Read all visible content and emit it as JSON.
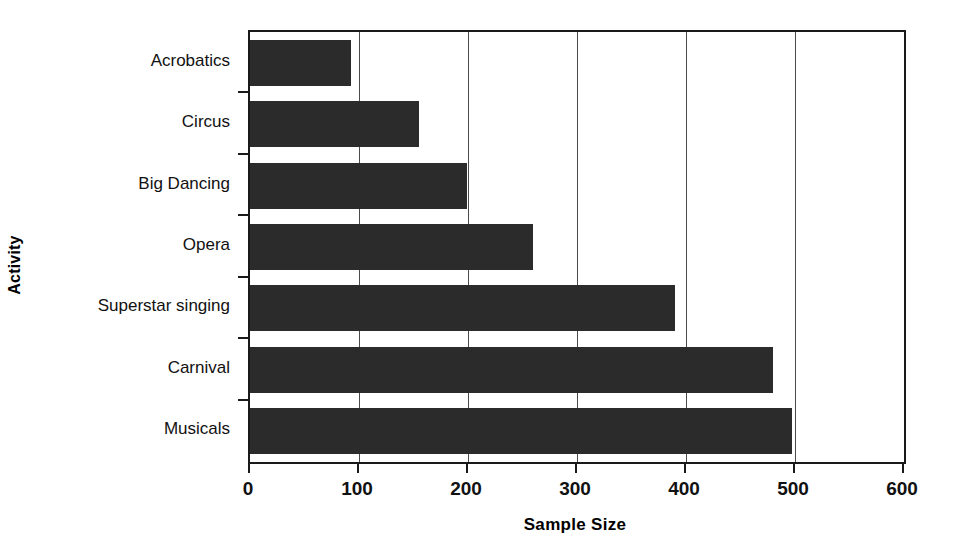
{
  "chart_data": {
    "type": "bar",
    "orientation": "horizontal",
    "title": "",
    "xlabel": "Sample Size",
    "ylabel": "Activity",
    "categories": [
      "Acrobatics",
      "Circus",
      "Big Dancing",
      "Opera",
      "Superstar singing",
      "Carnival",
      "Musicals"
    ],
    "values": [
      93,
      155,
      199,
      260,
      390,
      480,
      497
    ],
    "xlim": [
      0,
      600
    ],
    "xticks": [
      0,
      100,
      200,
      300,
      400,
      500,
      600
    ],
    "xtick_labels": [
      "0",
      "100",
      "200",
      "300",
      "400",
      "500",
      "600"
    ],
    "grid": "vertical",
    "legend": "none",
    "bar_color": "#2b2b2b",
    "axis_color": "#1a1a1a",
    "gridline_color": "#4a4a4a",
    "background": "#ffffff"
  }
}
